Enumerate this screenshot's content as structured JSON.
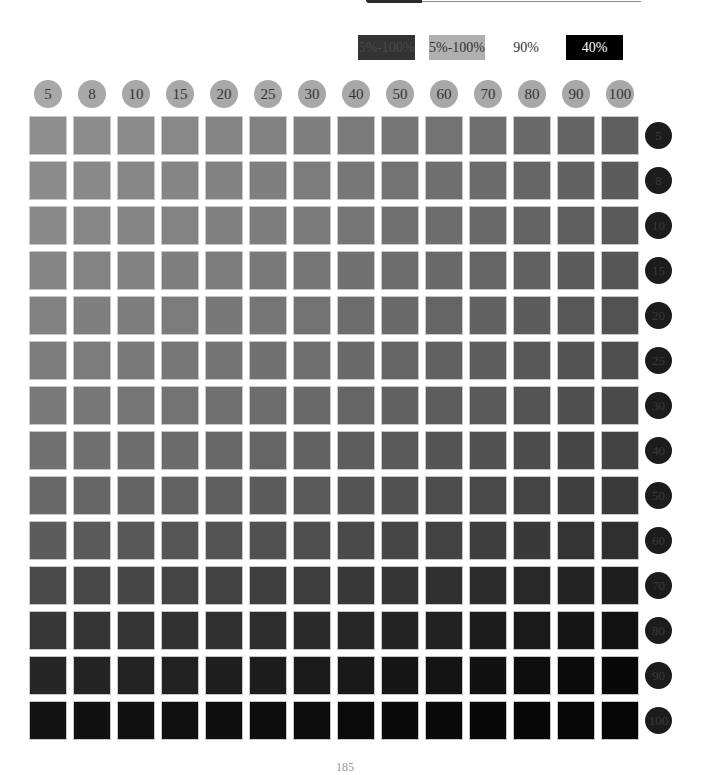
{
  "legend": {
    "items": [
      {
        "label": "5%-100%",
        "color": "#333333"
      },
      {
        "label": "5%-100%",
        "color": "#b0b0b0"
      },
      {
        "label": "90%",
        "color": "#ffffff"
      },
      {
        "label": "40%",
        "color": "#000000"
      }
    ]
  },
  "chart_data": {
    "type": "heatmap",
    "title": "",
    "xlabel": "",
    "ylabel": "",
    "legend_position": "top-right",
    "grid": false,
    "x_labels": [
      "5",
      "8",
      "10",
      "15",
      "20",
      "25",
      "30",
      "40",
      "50",
      "60",
      "70",
      "80",
      "90",
      "100"
    ],
    "y_labels": [
      "5",
      "8",
      "10",
      "15",
      "20",
      "25",
      "30",
      "40",
      "50",
      "60",
      "70",
      "80",
      "90",
      "100"
    ],
    "x_color": "#a8a8a8",
    "y_color": "#1c1c1c",
    "values_gray_level": [
      [
        142,
        140,
        138,
        136,
        133,
        130,
        127,
        122,
        118,
        114,
        110,
        105,
        100,
        95
      ],
      [
        139,
        137,
        135,
        133,
        130,
        127,
        124,
        119,
        115,
        111,
        107,
        102,
        97,
        92
      ],
      [
        137,
        135,
        133,
        131,
        128,
        125,
        122,
        117,
        113,
        109,
        105,
        100,
        95,
        90
      ],
      [
        133,
        131,
        129,
        127,
        124,
        121,
        118,
        113,
        109,
        105,
        101,
        96,
        91,
        86
      ],
      [
        129,
        127,
        125,
        123,
        120,
        117,
        114,
        109,
        105,
        101,
        97,
        92,
        87,
        82
      ],
      [
        125,
        123,
        121,
        119,
        116,
        113,
        110,
        105,
        101,
        97,
        93,
        88,
        83,
        78
      ],
      [
        121,
        119,
        117,
        115,
        112,
        109,
        106,
        101,
        97,
        93,
        89,
        84,
        79,
        74
      ],
      [
        113,
        111,
        109,
        107,
        104,
        101,
        98,
        93,
        89,
        85,
        81,
        76,
        71,
        66
      ],
      [
        104,
        102,
        100,
        98,
        95,
        92,
        89,
        85,
        81,
        77,
        73,
        68,
        63,
        58
      ],
      [
        92,
        90,
        88,
        86,
        84,
        81,
        78,
        74,
        70,
        66,
        62,
        57,
        52,
        47
      ],
      [
        74,
        72,
        70,
        68,
        66,
        63,
        60,
        56,
        52,
        48,
        44,
        40,
        36,
        31
      ],
      [
        55,
        53,
        51,
        49,
        47,
        45,
        42,
        39,
        36,
        33,
        29,
        26,
        22,
        18
      ],
      [
        38,
        36,
        35,
        33,
        31,
        29,
        27,
        25,
        22,
        20,
        17,
        14,
        11,
        8
      ],
      [
        18,
        17,
        16,
        15,
        14,
        13,
        12,
        11,
        10,
        9,
        8,
        7,
        6,
        5
      ]
    ]
  },
  "page": {
    "number": "185"
  }
}
